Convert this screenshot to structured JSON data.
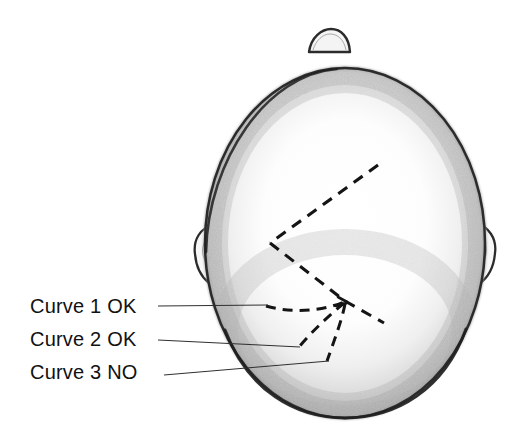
{
  "figure": {
    "kind": "anatomical-line-drawing",
    "background_color": "#ffffff",
    "ink_color": "#111111",
    "shading_color": "#8c8c8c",
    "outline_color": "#2b2b2b"
  },
  "labels": [
    {
      "id": "curve-1",
      "text": "Curve 1  OK",
      "verdict": "OK",
      "curve_number": "1"
    },
    {
      "id": "curve-2",
      "text": "Curve 2  OK",
      "verdict": "OK",
      "curve_number": "2"
    },
    {
      "id": "curve-3",
      "text": "Curve 3 NO",
      "verdict": "NO",
      "curve_number": "3"
    }
  ],
  "anatomy": {
    "head_outline": "ovoid skull seen from vertex",
    "nose_bump": "small anterior nose protrusion at top",
    "left_ear": "ear protruding at left margin",
    "right_ear": "ear protruding at right margin",
    "suture_chevron": "dashed chevron suture with apex pointing left",
    "lambda_junction": "point where the three curves converge",
    "lambdoid_suture": "dashed segment running down-right from the junction"
  },
  "leader_lines": [
    {
      "id": "leader-1",
      "from_label": "curve-1"
    },
    {
      "id": "leader-2",
      "from_label": "curve-2"
    },
    {
      "id": "leader-3",
      "from_label": "curve-3"
    }
  ]
}
